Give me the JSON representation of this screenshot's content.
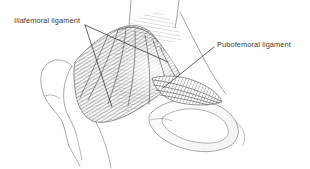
{
  "figure": {
    "background_color": "#ffffff",
    "ink_color": "#3a3a3a",
    "line_color": "#6d6d6d",
    "hatch_color": "#555555",
    "width": 310,
    "height": 169
  },
  "labels": {
    "iliofemoral": {
      "text": "Iliafemoral ligament",
      "x": 14,
      "y": 16,
      "leader_origin": [
        85,
        25
      ],
      "leader_targets": [
        [
          112,
          107
        ],
        [
          168,
          62
        ]
      ]
    },
    "pubofemoral": {
      "text": "Pubofemoral ligament",
      "x": 217,
      "y": 40,
      "leader_origin": [
        214,
        48
      ],
      "leader_targets": [
        [
          163,
          88
        ]
      ]
    }
  },
  "anatomy": {
    "structures": [
      {
        "name": "femur-greater-trochanter",
        "side": "left"
      },
      {
        "name": "femoral-shaft",
        "side": "left-bottom"
      },
      {
        "name": "iliofemoral-ligament-fan",
        "side": "center"
      },
      {
        "name": "iliac-crest",
        "side": "top"
      },
      {
        "name": "pubofemoral-ligament-fan",
        "side": "right"
      },
      {
        "name": "obturator-foramen",
        "side": "right-bottom"
      },
      {
        "name": "pubic-ramus",
        "side": "right"
      }
    ]
  }
}
